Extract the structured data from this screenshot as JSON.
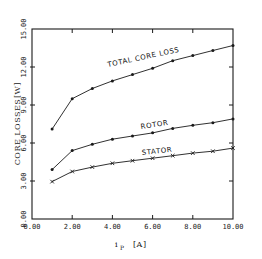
{
  "chart_data": {
    "type": "line",
    "title": "",
    "xlabel": "i_P [A]",
    "ylabel": "CORE LOSSES [W]",
    "xlim": [
      0,
      10
    ],
    "ylim": [
      0,
      15
    ],
    "grid": false,
    "legend": "inline labels on curves",
    "x_ticks": [
      "0.00",
      "2.00",
      "4.00",
      "6.00",
      "8.00",
      "10.00"
    ],
    "y_ticks": [
      "0.00",
      "3.00",
      "6.00",
      "9.00",
      "12.00",
      "15.00"
    ],
    "x": [
      1,
      2,
      3,
      4,
      5,
      6,
      7,
      8,
      9,
      10
    ],
    "series": [
      {
        "name": "TOTAL CORE LOSS",
        "marker": "dot",
        "values": [
          7.1,
          9.5,
          10.3,
          10.9,
          11.4,
          11.9,
          12.5,
          12.9,
          13.3,
          13.7
        ]
      },
      {
        "name": "ROTOR",
        "marker": "dot",
        "values": [
          3.9,
          5.4,
          5.9,
          6.3,
          6.55,
          6.8,
          7.15,
          7.4,
          7.6,
          7.9
        ]
      },
      {
        "name": "STATOR",
        "marker": "x",
        "values": [
          2.95,
          3.75,
          4.1,
          4.4,
          4.6,
          4.8,
          5.0,
          5.2,
          5.35,
          5.6
        ]
      }
    ]
  },
  "labels": {
    "ylabel_text": "CORE LOSSES",
    "ylabel_unit": "[W]",
    "xlabel_var": "i",
    "xlabel_sub": "P",
    "xlabel_unit": "[A]",
    "total": "TOTAL CORE LOSS",
    "rotor": "ROTOR",
    "stator": "STATOR"
  }
}
